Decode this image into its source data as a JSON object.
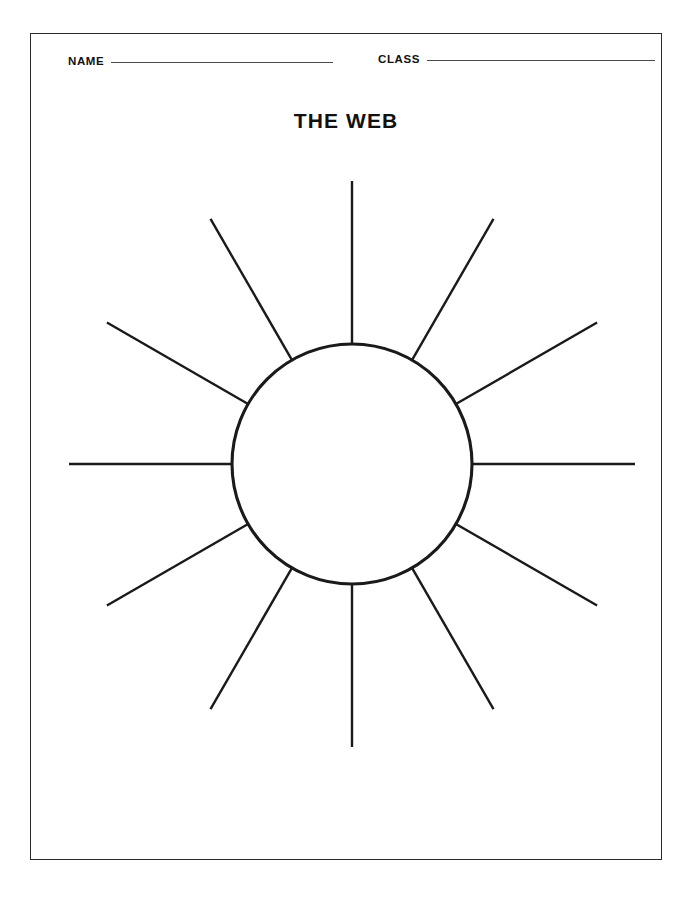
{
  "page": {
    "title": "THE WEB",
    "background_color": "#ffffff",
    "border_color": "#2b2b2b",
    "ink_color": "#1a1a1a"
  },
  "header": {
    "fields": [
      {
        "label": "NAME",
        "value": "",
        "rule_width": 222
      },
      {
        "label": "CLASS",
        "value": "",
        "rule_width": 228
      }
    ]
  },
  "diagram": {
    "name": "radial-web-graphic-organizer",
    "type": "web",
    "center_x": 322,
    "center_y": 314,
    "hub_radius": 120,
    "spoke_outer_radius": 283,
    "spoke_count": 12,
    "spoke_angle_step_degrees": 30,
    "hub_label": "",
    "spoke_labels": [
      "",
      "",
      "",
      "",
      "",
      "",
      "",
      "",
      "",
      "",
      "",
      ""
    ]
  }
}
